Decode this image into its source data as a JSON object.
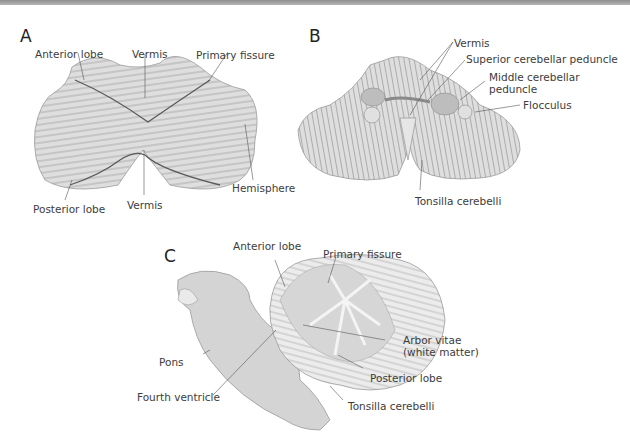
{
  "figure": {
    "type": "anatomical-illustration",
    "colors": {
      "tissue": "#dcdcdc",
      "tissue_dark": "#c8c8c8",
      "line": "#7a7a7a",
      "fissure": "#5a5a5a",
      "white_matter": "#f4f4f4",
      "peduncle": "#bdbdbd"
    },
    "panels": [
      {
        "letter": "A",
        "labels": {
          "anterior_lobe": "Anterior lobe",
          "vermis_top": "Vermis",
          "primary_fissure": "Primary fissure",
          "hemisphere": "Hemisphere",
          "posterior_lobe": "Posterior lobe",
          "vermis_bottom": "Vermis"
        }
      },
      {
        "letter": "B",
        "labels": {
          "vermis": "Vermis",
          "superior_peduncle": "Superior cerebellar peduncle",
          "middle_peduncle_1": "Middle cerebellar",
          "middle_peduncle_2": "peduncle",
          "flocculus": "Flocculus",
          "tonsilla": "Tonsilla cerebelli"
        }
      },
      {
        "letter": "C",
        "labels": {
          "anterior_lobe": "Anterior lobe",
          "primary_fissure": "Primary fissure",
          "arbor_vitae_1": "Arbor vitae",
          "arbor_vitae_2": "(white matter)",
          "pons": "Pons",
          "fourth_ventricle": "Fourth ventricle",
          "posterior_lobe": "Posterior lobe",
          "tonsilla": "Tonsilla cerebelli"
        }
      }
    ]
  }
}
